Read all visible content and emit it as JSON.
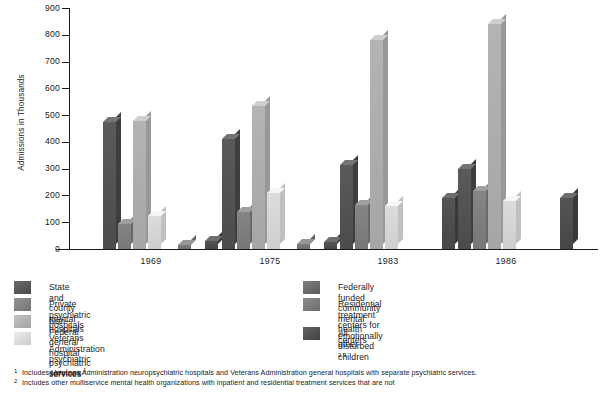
{
  "chart_data": {
    "type": "bar",
    "title": "",
    "xlabel": "",
    "ylabel": "Admissions in Thousands",
    "ylim": [
      0,
      900
    ],
    "yticks": [
      0,
      100,
      200,
      300,
      400,
      500,
      600,
      700,
      800,
      900
    ],
    "grid": false,
    "legend_position": "below",
    "categories": [
      "1969",
      "1975",
      "1983",
      "1986"
    ],
    "series": [
      {
        "name": "State and county mental hospitals",
        "color": "#5a5a5a",
        "values": [
          475,
          410,
          315,
          300
        ]
      },
      {
        "name": "Private psychiatric hospitals",
        "color": "#858585",
        "values": [
          92,
          140,
          165,
          215
        ]
      },
      {
        "name": "Non-Federal general hospital psychiatric services",
        "color": "#b4b4b4",
        "values": [
          478,
          535,
          780,
          840
        ]
      },
      {
        "name": "Veterans Administration psychiatric services",
        "color": "#dcdcdc",
        "values": [
          125,
          210,
          160,
          180
        ]
      },
      {
        "name": "Federally funded community mental health centers",
        "color": "#6e6e6e",
        "values": [
          0,
          0,
          0,
          0
        ]
      },
      {
        "name": "Residential treatment centers for emotionally disturbed children",
        "color": "#7d7d7d",
        "values": [
          15,
          20,
          0,
          0
        ]
      },
      {
        "name": "All other",
        "color": "#545454",
        "values": [
          30,
          25,
          190,
          190
        ]
      }
    ]
  },
  "axis": {
    "y_title": "Admissions in Thousands",
    "tick_labels": [
      "900",
      "800",
      "700",
      "600",
      "500",
      "400",
      "300",
      "200",
      "100",
      "0"
    ]
  },
  "legend": {
    "left_column": [
      {
        "label": "State and county mental hospitals",
        "swatch": "#5a5a5a",
        "footnote": ""
      },
      {
        "label": "Private psychiatric hospitals",
        "swatch": "#858585",
        "footnote": ""
      },
      {
        "label": "Non-Federal general hospital psychiatric services",
        "swatch": "#b4b4b4",
        "footnote": ""
      },
      {
        "label": "Veterans Administration psychiatric services",
        "swatch": "#dcdcdc",
        "footnote": "1"
      }
    ],
    "right_column": [
      {
        "label": "Federally funded community mental health centers",
        "swatch": "#6e6e6e",
        "footnote": ""
      },
      {
        "label": "Residential treatment centers for\nemotionally disturbed children",
        "swatch": "#7d7d7d",
        "footnote": ""
      },
      {
        "label": "All other",
        "swatch": "#545454",
        "footnote": "2,3"
      }
    ]
  },
  "footnotes": [
    {
      "marker": "1",
      "text": "Includes Veterans Administration neuropsychiatric hospitals and Veterans Administration general hospitals with separate psychiatric services."
    },
    {
      "marker": "2",
      "text": "Includes other multiservice mental health organizations with inpatient and residential treatment services that are not"
    }
  ]
}
